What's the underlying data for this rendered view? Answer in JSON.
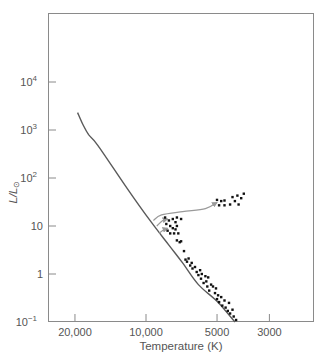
{
  "chart_data": {
    "type": "scatter",
    "title": "",
    "xlabel": "Temperature (K)",
    "ylabel": "L/L☉",
    "x_scale": "log-reversed",
    "y_scale": "log",
    "xlim": [
      24000,
      2200
    ],
    "ylim": [
      0.1,
      100000
    ],
    "grid": false,
    "legend": null,
    "x_ticks": [
      {
        "value": 20000,
        "label": "20,000"
      },
      {
        "value": 10000,
        "label": "10,000"
      },
      {
        "value": 5000,
        "label": "5000"
      },
      {
        "value": 3000,
        "label": "3000"
      }
    ],
    "y_ticks": [
      {
        "value": 0.1,
        "base": "10",
        "exp": "−1"
      },
      {
        "value": 1,
        "base": "1",
        "exp": ""
      },
      {
        "value": 10,
        "base": "10",
        "exp": ""
      },
      {
        "value": 100,
        "base": "10",
        "exp": "2"
      },
      {
        "value": 1000,
        "base": "10",
        "exp": "3"
      },
      {
        "value": 10000,
        "base": "10",
        "exp": "4"
      }
    ],
    "series": [
      {
        "name": "zero-age main sequence",
        "kind": "line",
        "points": [
          [
            19500,
            2300
          ],
          [
            18500,
            1300
          ],
          [
            17500,
            800
          ],
          [
            16000,
            480
          ],
          [
            12000,
            60
          ],
          [
            9500,
            12
          ],
          [
            8000,
            4
          ],
          [
            7000,
            1.7
          ],
          [
            6000,
            0.6
          ],
          [
            5000,
            0.27
          ],
          [
            4200,
            0.1
          ]
        ]
      },
      {
        "name": "evolution tracks (arrows)",
        "kind": "arrows",
        "tracks": [
          [
            [
              9300,
              13
            ],
            [
              8600,
              17
            ],
            [
              7000,
              20
            ],
            [
              5600,
              23
            ],
            [
              5000,
              31
            ]
          ],
          [
            [
              9000,
              10
            ],
            [
              8500,
              13
            ],
            [
              8100,
              14
            ]
          ],
          [
            [
              8800,
              7
            ],
            [
              8400,
              8.5
            ],
            [
              8100,
              9
            ]
          ]
        ]
      },
      {
        "name": "red giants",
        "kind": "points",
        "points": [
          [
            5000,
            35
          ],
          [
            4900,
            27
          ],
          [
            4800,
            33
          ],
          [
            4650,
            34
          ],
          [
            4650,
            27
          ],
          [
            4400,
            28
          ],
          [
            4300,
            40
          ],
          [
            4200,
            33
          ],
          [
            4100,
            43
          ],
          [
            4050,
            28
          ],
          [
            3950,
            38
          ],
          [
            3850,
            47
          ]
        ]
      },
      {
        "name": "turnoff / subgiants",
        "kind": "points",
        "points": [
          [
            8300,
            15
          ],
          [
            8200,
            11
          ],
          [
            8100,
            8
          ],
          [
            8000,
            13
          ],
          [
            7900,
            10
          ],
          [
            7900,
            7
          ],
          [
            7700,
            14
          ],
          [
            7700,
            9
          ],
          [
            7600,
            7
          ],
          [
            7500,
            12
          ],
          [
            7500,
            8.5
          ],
          [
            7400,
            15
          ],
          [
            7400,
            10
          ],
          [
            7300,
            7
          ],
          [
            7100,
            14
          ],
          [
            7400,
            5
          ],
          [
            7200,
            4.6
          ],
          [
            7100,
            4.8
          ],
          [
            6900,
            3
          ]
        ]
      },
      {
        "name": "main sequence stars",
        "kind": "points",
        "points": [
          [
            6800,
            2.0
          ],
          [
            6700,
            1.8
          ],
          [
            6600,
            2.1
          ],
          [
            6500,
            1.5
          ],
          [
            6400,
            1.7
          ],
          [
            6350,
            1.3
          ],
          [
            6200,
            1.4
          ],
          [
            6100,
            1.1
          ],
          [
            6000,
            0.95
          ],
          [
            5900,
            1.2
          ],
          [
            5850,
            0.8
          ],
          [
            5800,
            1.0
          ],
          [
            5700,
            0.65
          ],
          [
            5600,
            0.9
          ],
          [
            5550,
            0.7
          ],
          [
            5500,
            0.55
          ],
          [
            5450,
            0.85
          ],
          [
            5400,
            0.45
          ],
          [
            5300,
            0.6
          ],
          [
            5200,
            0.55
          ],
          [
            5100,
            0.4
          ],
          [
            5050,
            0.5
          ],
          [
            5000,
            0.3
          ],
          [
            4950,
            0.36
          ],
          [
            4900,
            0.26
          ],
          [
            4800,
            0.33
          ],
          [
            4750,
            0.22
          ],
          [
            4650,
            0.28
          ],
          [
            4600,
            0.2
          ],
          [
            4500,
            0.17
          ],
          [
            4450,
            0.25
          ],
          [
            4400,
            0.15
          ],
          [
            4300,
            0.18
          ],
          [
            4250,
            0.13
          ],
          [
            4150,
            0.11
          ]
        ]
      }
    ]
  },
  "colors": {
    "frame": "#8a8a8a",
    "curve": "#5a5a5a",
    "arrow": "#9a9a9a",
    "points": "#111111",
    "text": "#555555"
  }
}
